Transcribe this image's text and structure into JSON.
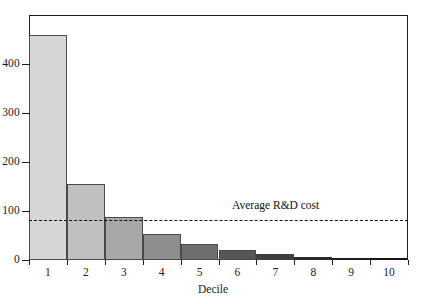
{
  "chart_data": {
    "type": "bar",
    "title": "",
    "subtitle": "",
    "xlabel": "Decile",
    "ylabel": "",
    "categories": [
      "1",
      "2",
      "3",
      "4",
      "5",
      "6",
      "7",
      "8",
      "9",
      "10"
    ],
    "values": [
      460,
      155,
      88,
      53,
      33,
      20,
      12,
      7,
      4,
      2
    ],
    "series": [
      {
        "name": "Revenue by decile",
        "values": [
          460,
          155,
          88,
          53,
          33,
          20,
          12,
          7,
          4,
          2
        ]
      }
    ],
    "bar_colors": [
      "#d6d6d6",
      "#c0c0c0",
      "#a8a8a8",
      "#8e8e8e",
      "#6f6f6f",
      "#565656",
      "#3f3f3f",
      "#2a2a2a",
      "#1d1d1d",
      "#141414"
    ],
    "ylim": [
      0,
      500
    ],
    "yticks": [
      0,
      100,
      200,
      300,
      400
    ],
    "ytick_labels": [
      "0",
      "100",
      "200",
      "300",
      "400"
    ],
    "xtick_labels": [
      "1",
      "2",
      "3",
      "4",
      "5",
      "6",
      "7",
      "8",
      "9",
      "10"
    ],
    "grid": false,
    "legend": null,
    "legend_position": "none",
    "annotations": [
      {
        "name": "average-rd-cost-line",
        "label": "Average R&D cost",
        "value": 81,
        "style": "dashed",
        "color": "#101010",
        "label_x_category": "7"
      }
    ]
  },
  "axes": {
    "x_title": "Decile",
    "y_title": ""
  }
}
